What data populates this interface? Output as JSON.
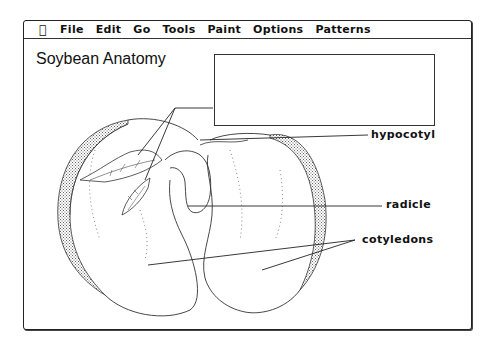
{
  "menubar": {
    "apple_icon": "apple-icon",
    "items": [
      "File",
      "Edit",
      "Go",
      "Tools",
      "Paint",
      "Options",
      "Patterns"
    ]
  },
  "page": {
    "title": "Soybean Anatomy"
  },
  "labelbox": {
    "value": ""
  },
  "labels": {
    "hypocotyl": "hypocotyl",
    "radicle": "radicle",
    "cotyledons": "cotyledons"
  },
  "colors": {
    "ink": "#111111",
    "seed_coat_shade": "#a0a0a0",
    "background": "#ffffff"
  }
}
